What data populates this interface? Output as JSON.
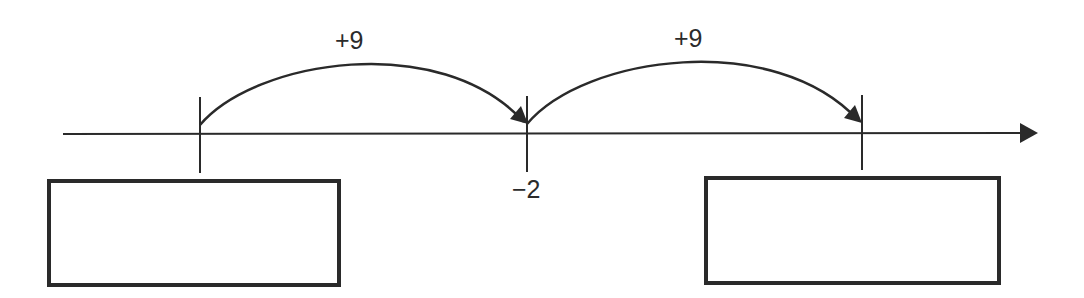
{
  "diagram": {
    "type": "number-line-jumps",
    "colors": {
      "stroke": "#2a2a2a",
      "text": "#2b2b2b",
      "background": "#ffffff"
    },
    "number_line": {
      "direction": "right",
      "ticks": [
        {
          "position": "left",
          "label": ""
        },
        {
          "position": "middle",
          "label": "−2"
        },
        {
          "position": "right",
          "label": ""
        }
      ]
    },
    "jumps": [
      {
        "from": "left",
        "to": "middle",
        "label": "+9"
      },
      {
        "from": "middle",
        "to": "right",
        "label": "+9"
      }
    ],
    "answer_boxes": [
      {
        "position": "left",
        "value": ""
      },
      {
        "position": "right",
        "value": ""
      }
    ]
  }
}
